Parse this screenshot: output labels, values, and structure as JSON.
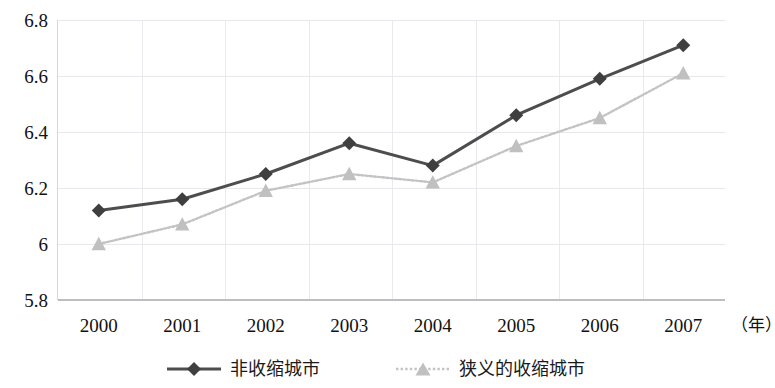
{
  "chart_data": {
    "type": "line",
    "title": "",
    "subtitle": "",
    "xlabel": "（年）",
    "ylabel": "",
    "categories": [
      "2000",
      "2001",
      "2002",
      "2003",
      "2004",
      "2005",
      "2006",
      "2007"
    ],
    "ylim": [
      5.8,
      6.8
    ],
    "yticks": [
      "5.8",
      "6",
      "6.2",
      "6.4",
      "6.6",
      "6.8"
    ],
    "ytick_values": [
      5.8,
      6.0,
      6.2,
      6.4,
      6.6,
      6.8
    ],
    "grid": true,
    "legend_position": "bottom",
    "series": [
      {
        "name": "非收缩城市",
        "color": "#4d4d4d",
        "marker": "diamond",
        "linestyle": "solid",
        "values": [
          6.12,
          6.16,
          6.25,
          6.36,
          6.28,
          6.46,
          6.59,
          6.71
        ]
      },
      {
        "name": "狭义的收缩城市",
        "color": "#c3c3c3",
        "marker": "triangle",
        "linestyle": "dotted",
        "values": [
          6.0,
          6.07,
          6.19,
          6.25,
          6.22,
          6.35,
          6.45,
          6.61
        ]
      }
    ]
  },
  "axis": {
    "x_unit_label": "（年）"
  },
  "legend": {
    "items": [
      {
        "label": "非收缩城市"
      },
      {
        "label": "狭义的收缩城市"
      }
    ]
  },
  "colors": {
    "series_dark": "#4d4d4d",
    "series_light": "#c3c3c3",
    "grid": "#e7e7ec",
    "axis": "#bdbdc2",
    "text": "#111111"
  }
}
